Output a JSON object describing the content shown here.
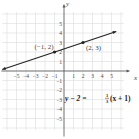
{
  "chart_data": {
    "type": "line",
    "title": "",
    "xlabel": "x",
    "ylabel": "y",
    "xlim": [
      -6,
      6
    ],
    "ylim": [
      -6,
      6
    ],
    "grid": true,
    "x_ticks": [
      -5,
      -4,
      -3,
      -2,
      -1,
      1,
      2,
      3,
      4,
      5
    ],
    "y_ticks": [
      -5,
      -4,
      -3,
      -2,
      -1,
      1,
      2,
      3,
      4,
      5
    ],
    "series": [
      {
        "name": "y - 2 = 1/3(x + 1)",
        "x": [
          -6.5,
          -1,
          2,
          5.5
        ],
        "y": [
          0.1667,
          2,
          3,
          4.1667
        ],
        "arrows": "both"
      }
    ],
    "points": [
      {
        "x": -1,
        "y": 2,
        "label": "(−1, 2)"
      },
      {
        "x": 2,
        "y": 3,
        "label": "(2, 3)"
      }
    ],
    "equation": {
      "lhs": "y − 2 = ",
      "frac_num": "1",
      "frac_den": "3",
      "rhs": "(x + 1)"
    }
  }
}
